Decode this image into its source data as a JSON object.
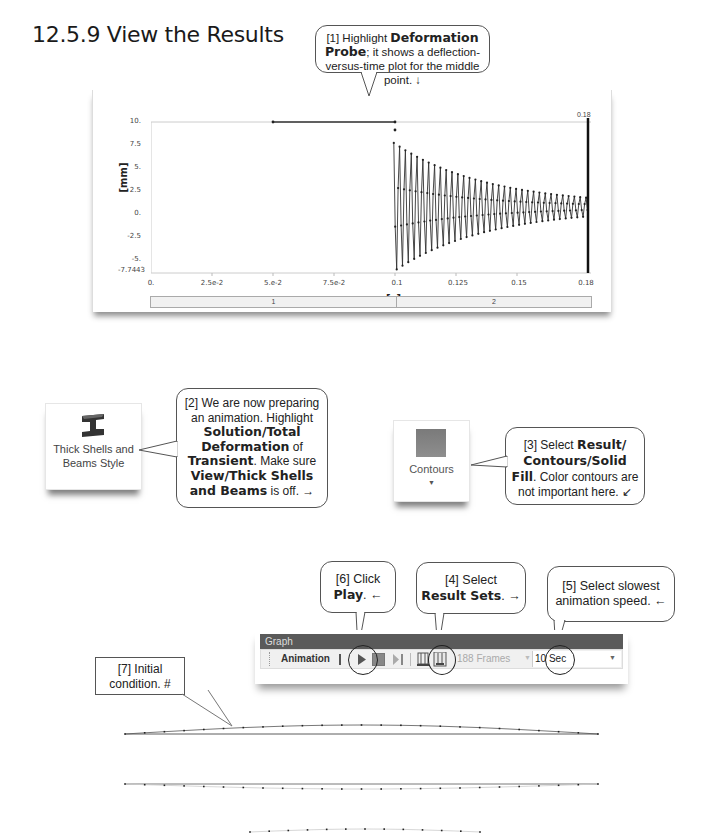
{
  "heading": "12.5.9 View the Results",
  "callouts": {
    "c1": {
      "pre": "[1] Highlight ",
      "bold": "Deformation Probe",
      "post": "; it shows a deflection-versus-time plot for the middle point. ↓"
    },
    "c2": {
      "line1": "[2] We are now preparing an animation.  Highlight",
      "bold1": "Solution/Total Deformation",
      "mid1": " of ",
      "bold2": "Transient",
      "mid2": ".  Make sure ",
      "bold3": "View/Thick Shells and Beams",
      "post": " is off.  →"
    },
    "c3": {
      "pre": "[3] Select ",
      "bold": "Result/ Contours/Solid Fill",
      "post": ". Color contours are not important here.  ↙"
    },
    "c4": {
      "pre": "[4] Select ",
      "bold": "Result Sets",
      "post": ".  →"
    },
    "c5": {
      "text": "[5] Select slowest animation speed.  ←"
    },
    "c6": {
      "pre": "[6] Click ",
      "bold": "Play",
      "post": ".  ←"
    },
    "c7": {
      "text": "[7] Initial condition.  #"
    }
  },
  "chart_data": {
    "type": "line",
    "title": "",
    "xlabel": "[s]",
    "ylabel": "[mm]",
    "ylim": [
      -7.7443,
      10
    ],
    "xlim": [
      0,
      0.18
    ],
    "y_ticks": [
      "10.",
      "7.5",
      "5.",
      "2.5",
      "0.",
      "-2.5",
      "-5.",
      "-7.7443"
    ],
    "x_ticks": [
      "0.",
      "2.5e-2",
      "5.e-2",
      "7.5e-2",
      "0.1",
      "0.125",
      "0.15",
      "0.18"
    ],
    "cursor_label": "0.18",
    "grid": false,
    "legend": "none",
    "series": [
      {
        "name": "Deformation Probe",
        "description": "Constant 10 mm from 0.05 to 0.1 s, then damped oscillation decaying from about ±7.7 mm to about ±1 mm at 0.18 s",
        "x": [
          0.05,
          0.1,
          0.101,
          0.11,
          0.12,
          0.13,
          0.14,
          0.15,
          0.16,
          0.17,
          0.18
        ],
        "envelope_max": [
          10,
          10,
          7.7,
          6.5,
          5.0,
          3.8,
          2.9,
          2.2,
          1.7,
          1.3,
          1.0
        ],
        "envelope_min": [
          10,
          10,
          -7.7,
          -6.3,
          -4.8,
          -3.7,
          -2.8,
          -2.1,
          -1.6,
          -1.2,
          -1.0
        ]
      }
    ],
    "step_bar": [
      "1",
      "2"
    ]
  },
  "ribbon": {
    "thick_shells": {
      "label": "Thick Shells and Beams Style",
      "icon": "i-beam-icon"
    },
    "contours": {
      "label": "Contours",
      "icon": "contour-swatch-icon"
    }
  },
  "graph_toolbar": {
    "title": "Graph",
    "animation_label": "Animation",
    "frames": "188 Frames",
    "speed": "10 Sec"
  }
}
